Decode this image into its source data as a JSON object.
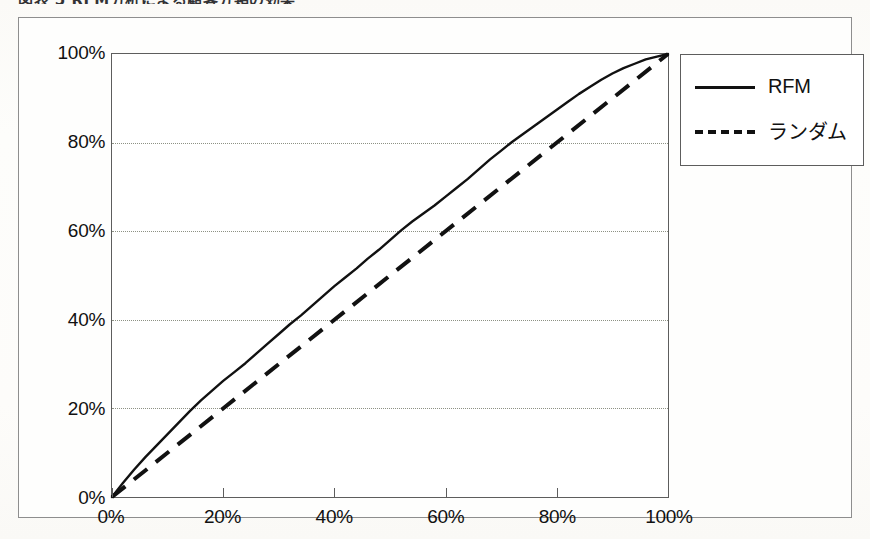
{
  "caption": {
    "text": "図表 5 RFM分析による顧客分類の効果"
  },
  "legend": {
    "position": "top-right",
    "entries": [
      {
        "label": "RFM",
        "style": "solid",
        "color": "#111111"
      },
      {
        "label": "ランダム",
        "style": "dashed",
        "color": "#111111"
      }
    ]
  },
  "axes": {
    "y_ticks": [
      "100%",
      "80%",
      "60%",
      "40%",
      "20%",
      "0%"
    ],
    "x_ticks": [
      "0%",
      "20%",
      "40%",
      "60%",
      "80%",
      "100%"
    ]
  },
  "chart_data": {
    "type": "line",
    "title": "",
    "subtitle": "",
    "xlabel": "",
    "ylabel": "",
    "xlim": [
      0,
      100
    ],
    "ylim": [
      0,
      100
    ],
    "grid": true,
    "grid_axis": "y",
    "grid_values": [
      20,
      40,
      60,
      80
    ],
    "xticks": [
      0,
      20,
      40,
      60,
      80,
      100
    ],
    "yticks": [
      0,
      20,
      40,
      60,
      80,
      100
    ],
    "xtick_labels": [
      "0%",
      "20%",
      "40%",
      "60%",
      "80%",
      "100%"
    ],
    "ytick_labels": [
      "0%",
      "20%",
      "40%",
      "60%",
      "80%",
      "100%"
    ],
    "legend_position": "upper right",
    "series": [
      {
        "name": "RFM",
        "style": "solid",
        "color": "#111111",
        "x": [
          0,
          2,
          4,
          6,
          8,
          10,
          12,
          14,
          16,
          18,
          20,
          22,
          24,
          26,
          28,
          30,
          32,
          34,
          36,
          38,
          40,
          42,
          44,
          46,
          48,
          50,
          52,
          54,
          56,
          58,
          60,
          62,
          64,
          66,
          68,
          70,
          72,
          74,
          76,
          78,
          80,
          82,
          84,
          86,
          88,
          90,
          92,
          94,
          96,
          98,
          100
        ],
        "values": [
          0,
          3.2,
          6.2,
          9.0,
          11.6,
          14.2,
          16.8,
          19.4,
          21.8,
          24.0,
          26.2,
          28.2,
          30.2,
          32.4,
          34.6,
          36.8,
          39.0,
          41.0,
          43.2,
          45.4,
          47.6,
          49.6,
          51.6,
          53.8,
          55.8,
          58.0,
          60.2,
          62.2,
          64.0,
          65.8,
          67.8,
          69.8,
          71.8,
          74.0,
          76.2,
          78.2,
          80.2,
          82.0,
          83.8,
          85.6,
          87.4,
          89.2,
          91.0,
          92.6,
          94.2,
          95.6,
          96.8,
          97.8,
          98.8,
          99.4,
          100
        ]
      },
      {
        "name": "ランダム",
        "style": "dashed",
        "color": "#111111",
        "x": [
          0,
          100
        ],
        "values": [
          0,
          100
        ]
      }
    ]
  }
}
